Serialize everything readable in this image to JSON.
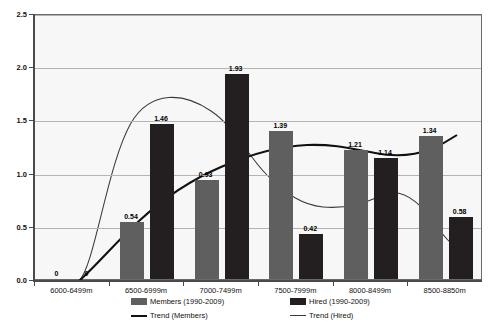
{
  "chart_data": {
    "type": "bar",
    "title": "",
    "xlabel": "",
    "ylabel": "",
    "ylim": [
      0.0,
      2.5
    ],
    "ytick_values": [
      0.0,
      0.5,
      1.0,
      1.5,
      2.0,
      2.5
    ],
    "ytick_labels": [
      "0.0",
      "0.5",
      "1.0",
      "1.5",
      "2.0",
      "2.5"
    ],
    "grid": true,
    "legend_position": "bottom",
    "categories": [
      "6000-6499m",
      "6500-6999m",
      "7000-7499m",
      "7500-7999m",
      "8000-8499m",
      "8500-8850m"
    ],
    "series": [
      {
        "name": "Members (1990-2009)",
        "type": "bar",
        "color": "#5f5f5f",
        "values": [
          0,
          0.54,
          0.93,
          1.39,
          1.21,
          1.34
        ],
        "labels": [
          "0",
          "0.54",
          "0.93",
          "1.39",
          "1.21",
          "1.34"
        ]
      },
      {
        "name": "Hired (1990-2009)",
        "type": "bar",
        "color": "#231f20",
        "values": [
          0,
          1.46,
          1.93,
          0.42,
          1.14,
          0.58
        ],
        "labels": [
          "0",
          "1.46",
          "1.93",
          "0.42",
          "1.14",
          "0.58"
        ]
      },
      {
        "name": "Trend (Members)",
        "type": "line",
        "color": "#111111",
        "values": [
          0.0,
          0.38,
          0.86,
          1.28,
          1.24,
          1.34
        ]
      },
      {
        "name": "Trend (Hired)",
        "type": "line",
        "color": "#3a3a3a",
        "values": [
          0.0,
          1.62,
          1.73,
          1.18,
          0.97,
          0.62
        ]
      }
    ]
  },
  "legend": {
    "members_label": "Members (1990-2009)",
    "hired_label": "Hired (1990-2009)",
    "trend_members_label": "Trend (Members)",
    "trend_hired_label": "Trend (Hired)"
  }
}
